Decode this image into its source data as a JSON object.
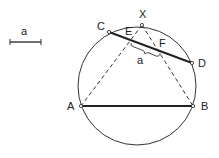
{
  "diagram": {
    "type": "geometry-construction",
    "scale_bar": {
      "label": "a",
      "x1": 10,
      "x2": 41,
      "y": 42
    },
    "circle": {
      "cx": 137,
      "cy": 86,
      "r": 59
    },
    "points": {
      "X": {
        "label": "X",
        "x": 142,
        "y": 25,
        "lx": 139,
        "ly": 18
      },
      "C": {
        "label": "C",
        "x": 109,
        "y": 32,
        "lx": 97,
        "ly": 30
      },
      "D": {
        "label": "D",
        "x": 192,
        "y": 63,
        "lx": 198,
        "ly": 67
      },
      "A": {
        "label": "A",
        "x": 81,
        "y": 106,
        "lx": 67,
        "ly": 110
      },
      "B": {
        "label": "B",
        "x": 193,
        "y": 106,
        "lx": 201,
        "ly": 110
      },
      "E": {
        "label": "E",
        "x": 131,
        "y": 42,
        "lx": 125,
        "ly": 35
      },
      "F": {
        "label": "F",
        "x": 160,
        "y": 52,
        "lx": 159,
        "ly": 47
      }
    },
    "segments": [
      {
        "from": "A",
        "to": "B",
        "style": "solid-thick"
      },
      {
        "from": "C",
        "to": "D",
        "style": "solid-thick"
      },
      {
        "from": "X",
        "to": "A",
        "style": "dashed"
      },
      {
        "from": "X",
        "to": "B",
        "style": "dashed"
      }
    ],
    "brace": {
      "between": [
        "E",
        "F"
      ],
      "label": "a",
      "lx": 137,
      "ly": 64
    }
  }
}
